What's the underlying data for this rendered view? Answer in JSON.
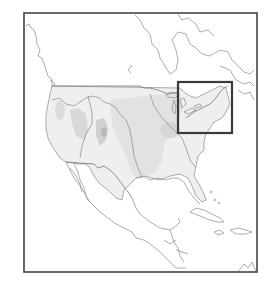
{
  "map": {
    "region": "North America (contiguous United States, southern Canada, Mexico, Central America, Caribbean)",
    "style": "grayscale outline map with shaded relief inside the United States",
    "frame": {
      "x": 24,
      "y": 13,
      "width": 233,
      "height": 259,
      "color": "#444444"
    },
    "highlight_box": {
      "label": "Northeast / Great Lakes - St. Lawrence region",
      "x": 178,
      "y": 82,
      "width": 54,
      "height": 51,
      "color": "#3a3a3a"
    },
    "colors": {
      "background": "#ffffff",
      "coastline": "#8a8a8a",
      "us_fill": "#efefef",
      "plains_fill": "#e2e2e2",
      "relief_shade": "#cfcfcf"
    }
  }
}
